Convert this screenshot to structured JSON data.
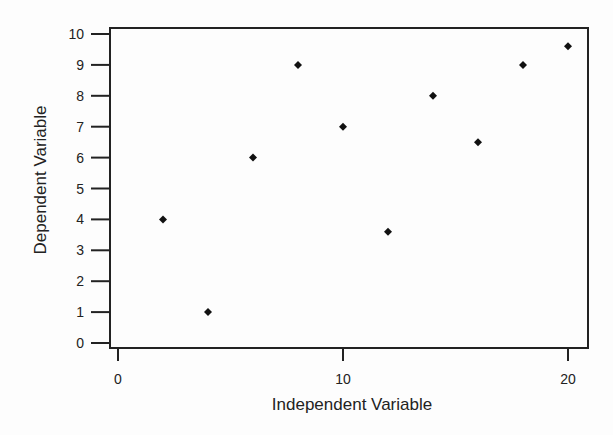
{
  "chart_data": {
    "type": "scatter",
    "title": "",
    "xlabel": "Independent Variable",
    "ylabel": "Dependent Variable",
    "xlim": [
      -0.4,
      20.9
    ],
    "ylim": [
      -0.15,
      10.2
    ],
    "xticks": [
      0,
      10,
      20
    ],
    "yticks": [
      0,
      1,
      2,
      3,
      4,
      5,
      6,
      7,
      8,
      9,
      10
    ],
    "grid": false,
    "legend": null,
    "marker": "diamond",
    "series": [
      {
        "name": "data",
        "x": [
          2,
          4,
          6,
          8,
          10,
          12,
          14,
          16,
          18,
          20
        ],
        "y": [
          4,
          1,
          6,
          9,
          7,
          3.6,
          8,
          6.5,
          9,
          9.6
        ]
      }
    ]
  },
  "colors": {
    "axis": "#222222",
    "marker": "#111111",
    "background": "#fdfdfd"
  }
}
